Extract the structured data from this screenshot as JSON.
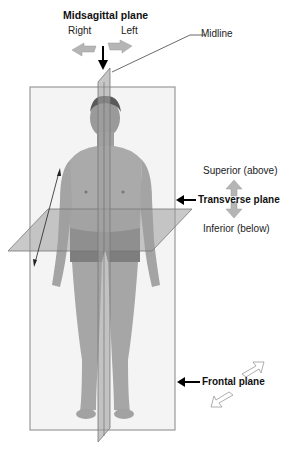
{
  "labels": {
    "midsagittal": "Midsagittal plane",
    "right": "Right",
    "left": "Left",
    "midline": "Midline",
    "superior": "Superior (above)",
    "transverse": "Transverse plane",
    "inferior": "Inferior (below)",
    "frontal": "Frontal plane"
  },
  "colors": {
    "plane_fill": "#a8a8a8",
    "plane_stroke": "#8c8c8c",
    "body_fill": "#a6a6a6",
    "body_dark": "#7a7a7a",
    "arrow_gray": "#b5b5b5",
    "text": "#222222"
  },
  "icons": [
    "down-arrow-icon",
    "left-arrow-icon",
    "right-arrow-icon",
    "up-arrow-icon",
    "double-headed-arrow-icon",
    "diagonal-arrow-icon"
  ]
}
